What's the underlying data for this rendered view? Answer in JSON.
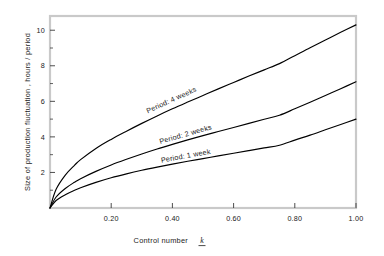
{
  "chart_data": {
    "type": "line",
    "title": "",
    "xlabel": "Control number",
    "xlabel_symbol": "k",
    "ylabel": "Size of production fluctuation , hours / period",
    "xlim": [
      0.0,
      1.0
    ],
    "ylim": [
      0.0,
      10.8
    ],
    "grid": false,
    "legend_position": "inline-on-curves",
    "xticks": [
      0.2,
      0.4,
      0.6,
      0.8,
      1.0
    ],
    "xtick_labels": [
      "0.20",
      "0.40",
      "0.60",
      "0.80",
      "1.00"
    ],
    "yticks": [
      2,
      4,
      6,
      8,
      10
    ],
    "ytick_labels": [
      "2",
      "4",
      "6",
      "8",
      "10"
    ],
    "yticks_minor": [
      1,
      3,
      5,
      7,
      9
    ],
    "x": [
      0.0,
      0.02,
      0.05,
      0.08,
      0.1,
      0.15,
      0.2,
      0.25,
      0.3,
      0.35,
      0.4,
      0.45,
      0.5,
      0.55,
      0.6,
      0.65,
      0.7,
      0.75,
      0.8,
      0.85,
      0.9,
      0.95,
      1.0
    ],
    "series": [
      {
        "name": "Period: 4 weeks",
        "label": "Period: 4 weeks",
        "values": [
          0.0,
          1.05,
          1.85,
          2.4,
          2.72,
          3.35,
          3.86,
          4.32,
          4.76,
          5.18,
          5.58,
          5.96,
          6.33,
          6.7,
          7.06,
          7.42,
          7.77,
          8.12,
          8.57,
          9.02,
          9.45,
          9.88,
          10.3
        ],
        "end_value": 10.3,
        "label_x": 0.4,
        "label_y": 5.95
      },
      {
        "name": "Period: 2 weeks",
        "label": "Period: 2 weeks",
        "values": [
          0.0,
          0.62,
          1.1,
          1.45,
          1.65,
          2.06,
          2.42,
          2.74,
          3.04,
          3.32,
          3.58,
          3.83,
          4.07,
          4.3,
          4.53,
          4.76,
          4.99,
          5.22,
          5.58,
          5.95,
          6.33,
          6.71,
          7.1
        ],
        "end_value": 7.1,
        "label_x": 0.445,
        "label_y": 4.02
      },
      {
        "name": "Period: 1 week",
        "label": "Period: 1 week",
        "values": [
          0.0,
          0.42,
          0.75,
          1.0,
          1.14,
          1.44,
          1.7,
          1.92,
          2.12,
          2.3,
          2.47,
          2.63,
          2.78,
          2.93,
          3.08,
          3.23,
          3.38,
          3.53,
          3.82,
          4.1,
          4.4,
          4.7,
          5.0
        ],
        "end_value": 5.0,
        "label_x": 0.445,
        "label_y": 2.8
      }
    ],
    "colors": {
      "curve": "#000000",
      "frame": "#c9c9c9",
      "text": "#1a1a1a",
      "background": "#ffffff"
    }
  }
}
